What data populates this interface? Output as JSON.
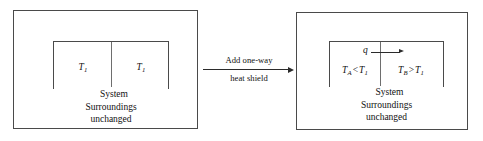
{
  "figure": {
    "type": "thermodynamics-schematic"
  },
  "left_panel": {
    "name": "before-state",
    "system_caption": "System",
    "surroundings_line1": "Surroundings",
    "surroundings_line2": "unchanged",
    "left_cell": {
      "symbol": "T",
      "subscript": "1"
    },
    "right_cell": {
      "symbol": "T",
      "subscript": "1"
    }
  },
  "transition": {
    "name": "add-one-way-heat-shield",
    "label_above": "Add one-way",
    "label_below": "heat shield",
    "arrow": "right-arrow"
  },
  "right_panel": {
    "name": "after-state",
    "system_caption": "System",
    "surroundings_line1": "Surroundings",
    "surroundings_line2": "unchanged",
    "heat_flux": {
      "symbol": "q",
      "direction": "left-to-right"
    },
    "left_cell": {
      "symbol": "T",
      "subscript": "A",
      "relation": "<",
      "compare_symbol": "T",
      "compare_subscript": "1"
    },
    "right_cell": {
      "symbol": "T",
      "subscript": "B",
      "relation": ">",
      "compare_symbol": "T",
      "compare_subscript": "1"
    }
  },
  "colors": {
    "stroke": "#4a4a4a",
    "partition": "#6e6e6e",
    "arrow": "#2b2b2b",
    "text": "#111111",
    "background": "#ffffff"
  }
}
